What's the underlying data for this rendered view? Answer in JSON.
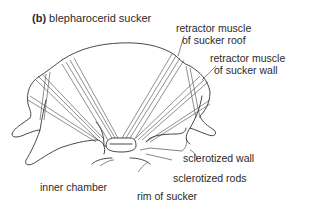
{
  "figure": {
    "panel_letter": "(b)",
    "title": "blepharocerid sucker",
    "labels": {
      "retractor_roof_1": "retractor muscle",
      "retractor_roof_2": "of sucker roof",
      "retractor_wall_1": "retractor muscle",
      "retractor_wall_2": "of sucker wall",
      "sclerotized_wall": "sclerotized wall",
      "sclerotized_rods": "sclerotized rods",
      "inner_chamber": "inner chamber",
      "rim_of_sucker": "rim of sucker"
    }
  }
}
